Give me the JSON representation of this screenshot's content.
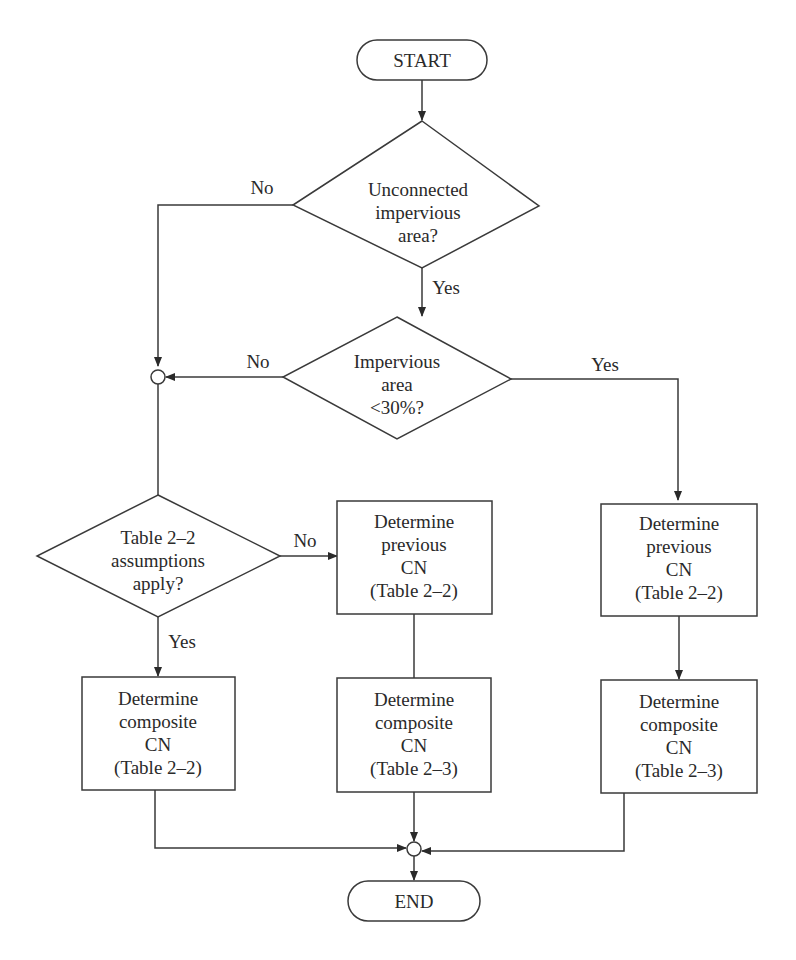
{
  "diagram": {
    "type": "flowchart",
    "terminals": {
      "start": "START",
      "end": "END"
    },
    "decisions": {
      "unconnected": [
        "Unconnected",
        "impervious",
        "area?"
      ],
      "impervious_pct": [
        "Impervious",
        "area",
        "<30%?"
      ],
      "table_assumptions": [
        "Table 2–2",
        "assumptions",
        "apply?"
      ]
    },
    "processes": {
      "prev_cn_mid": [
        "Determine",
        "previous",
        "CN",
        "(Table 2–2)"
      ],
      "prev_cn_right": [
        "Determine",
        "previous",
        "CN",
        "(Table 2–2)"
      ],
      "comp_cn_left": [
        "Determine",
        "composite",
        "CN",
        "(Table 2–2)"
      ],
      "comp_cn_mid": [
        "Determine",
        "composite",
        "CN",
        "(Table 2–3)"
      ],
      "comp_cn_right": [
        "Determine",
        "composite",
        "CN",
        "(Table 2–3)"
      ]
    },
    "edge_labels": {
      "unconnected_no": "No",
      "unconnected_yes": "Yes",
      "impervious_no": "No",
      "impervious_yes": "Yes",
      "assumptions_no": "No",
      "assumptions_yes": "Yes"
    }
  }
}
